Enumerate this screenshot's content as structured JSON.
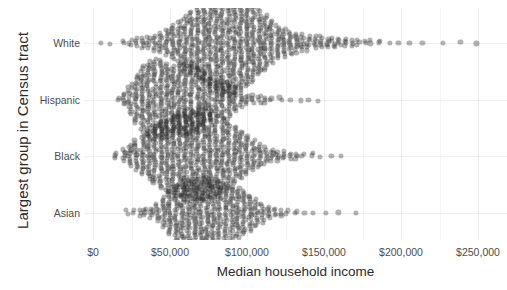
{
  "chart_data": {
    "type": "scatter",
    "plot_style": "beeswarm-strip",
    "title": "",
    "xlabel": "Median household income",
    "ylabel": "Largest group in Census tract",
    "xlim": [
      0,
      260000
    ],
    "ylim_categories": [
      "White",
      "Hispanic",
      "Black",
      "Asian"
    ],
    "x_tick_values": [
      0,
      50000,
      100000,
      150000,
      200000,
      250000
    ],
    "x_tick_labels": [
      "$0",
      "$50,000",
      "$100,000",
      "$150,000",
      "$200,000",
      "$250,000"
    ],
    "y_tick_labels": [
      "White",
      "Hispanic",
      "Black",
      "Asian"
    ],
    "grid": {
      "major_x": true,
      "minor_x": true,
      "major_y": true,
      "minor_y": false,
      "major_x_step": 50000,
      "minor_x_step": 25000,
      "color_major": "#ececf0",
      "color_minor": "#f5f5f8"
    },
    "legend": "none",
    "point_color": "#222222",
    "point_opacity": 0.35,
    "point_radius_px": 2.6,
    "series": [
      {
        "name": "White",
        "n_points": 980,
        "x_range": [
          8000,
          252000
        ],
        "peak_x": 90000,
        "median_x": 88000,
        "density_profile": [
          [
            5000,
            1
          ],
          [
            12000,
            1
          ],
          [
            20000,
            2
          ],
          [
            24000,
            3
          ],
          [
            28000,
            4
          ],
          [
            32000,
            5
          ],
          [
            36000,
            6
          ],
          [
            40000,
            7
          ],
          [
            44000,
            9
          ],
          [
            48000,
            12
          ],
          [
            52000,
            16
          ],
          [
            56000,
            20
          ],
          [
            60000,
            24
          ],
          [
            64000,
            28
          ],
          [
            68000,
            32
          ],
          [
            72000,
            36
          ],
          [
            76000,
            40
          ],
          [
            80000,
            44
          ],
          [
            84000,
            47
          ],
          [
            88000,
            48
          ],
          [
            92000,
            47
          ],
          [
            96000,
            44
          ],
          [
            100000,
            40
          ],
          [
            104000,
            35
          ],
          [
            108000,
            30
          ],
          [
            112000,
            25
          ],
          [
            116000,
            20
          ],
          [
            120000,
            16
          ],
          [
            124000,
            13
          ],
          [
            128000,
            11
          ],
          [
            132000,
            9
          ],
          [
            136000,
            8
          ],
          [
            140000,
            7
          ],
          [
            144000,
            6
          ],
          [
            148000,
            6
          ],
          [
            152000,
            5
          ],
          [
            156000,
            5
          ],
          [
            160000,
            4
          ],
          [
            164000,
            4
          ],
          [
            168000,
            3
          ],
          [
            172000,
            3
          ],
          [
            176000,
            2
          ],
          [
            180000,
            2
          ],
          [
            186000,
            2
          ],
          [
            192000,
            1
          ],
          [
            198000,
            1
          ],
          [
            206000,
            1
          ],
          [
            214000,
            1
          ],
          [
            226000,
            1
          ],
          [
            238000,
            1
          ],
          [
            250000,
            1
          ]
        ]
      },
      {
        "name": "Hispanic",
        "n_points": 620,
        "x_range": [
          15000,
          148000
        ],
        "peak_x": 45000,
        "median_x": 52000,
        "density_profile": [
          [
            16000,
            2
          ],
          [
            20000,
            6
          ],
          [
            24000,
            14
          ],
          [
            28000,
            22
          ],
          [
            32000,
            30
          ],
          [
            36000,
            34
          ],
          [
            40000,
            36
          ],
          [
            44000,
            36
          ],
          [
            48000,
            33
          ],
          [
            52000,
            31
          ],
          [
            56000,
            32
          ],
          [
            60000,
            33
          ],
          [
            64000,
            32
          ],
          [
            68000,
            30
          ],
          [
            72000,
            26
          ],
          [
            76000,
            20
          ],
          [
            80000,
            16
          ],
          [
            84000,
            17
          ],
          [
            88000,
            17
          ],
          [
            92000,
            12
          ],
          [
            96000,
            7
          ],
          [
            100000,
            5
          ],
          [
            104000,
            4
          ],
          [
            108000,
            4
          ],
          [
            112000,
            3
          ],
          [
            116000,
            2
          ],
          [
            122000,
            2
          ],
          [
            128000,
            1
          ],
          [
            134000,
            1
          ],
          [
            140000,
            1
          ],
          [
            146000,
            1
          ]
        ]
      },
      {
        "name": "Black",
        "n_points": 720,
        "x_range": [
          14000,
          165000
        ],
        "peak_x": 72000,
        "median_x": 68000,
        "density_profile": [
          [
            15000,
            3
          ],
          [
            20000,
            6
          ],
          [
            24000,
            10
          ],
          [
            28000,
            14
          ],
          [
            32000,
            18
          ],
          [
            36000,
            22
          ],
          [
            40000,
            26
          ],
          [
            44000,
            30
          ],
          [
            48000,
            33
          ],
          [
            52000,
            36
          ],
          [
            56000,
            38
          ],
          [
            60000,
            40
          ],
          [
            64000,
            41
          ],
          [
            68000,
            42
          ],
          [
            72000,
            42
          ],
          [
            76000,
            40
          ],
          [
            80000,
            37
          ],
          [
            84000,
            34
          ],
          [
            88000,
            30
          ],
          [
            92000,
            26
          ],
          [
            96000,
            22
          ],
          [
            100000,
            18
          ],
          [
            104000,
            14
          ],
          [
            108000,
            11
          ],
          [
            112000,
            8
          ],
          [
            116000,
            6
          ],
          [
            120000,
            5
          ],
          [
            124000,
            4
          ],
          [
            128000,
            3
          ],
          [
            132000,
            3
          ],
          [
            136000,
            2
          ],
          [
            142000,
            2
          ],
          [
            148000,
            1
          ],
          [
            154000,
            1
          ],
          [
            162000,
            1
          ]
        ]
      },
      {
        "name": "Asian",
        "n_points": 430,
        "x_range": [
          20000,
          172000
        ],
        "peak_x": 75000,
        "median_x": 78000,
        "density_profile": [
          [
            22000,
            2
          ],
          [
            26000,
            2
          ],
          [
            30000,
            3
          ],
          [
            34000,
            4
          ],
          [
            38000,
            5
          ],
          [
            42000,
            8
          ],
          [
            46000,
            14
          ],
          [
            50000,
            20
          ],
          [
            54000,
            25
          ],
          [
            58000,
            28
          ],
          [
            62000,
            30
          ],
          [
            66000,
            31
          ],
          [
            70000,
            31
          ],
          [
            74000,
            32
          ],
          [
            78000,
            31
          ],
          [
            82000,
            29
          ],
          [
            86000,
            27
          ],
          [
            90000,
            25
          ],
          [
            94000,
            23
          ],
          [
            98000,
            20
          ],
          [
            102000,
            17
          ],
          [
            106000,
            13
          ],
          [
            110000,
            9
          ],
          [
            114000,
            6
          ],
          [
            118000,
            4
          ],
          [
            122000,
            3
          ],
          [
            126000,
            2
          ],
          [
            132000,
            2
          ],
          [
            138000,
            1
          ],
          [
            144000,
            1
          ],
          [
            152000,
            1
          ],
          [
            160000,
            1
          ],
          [
            170000,
            1
          ]
        ]
      }
    ]
  }
}
